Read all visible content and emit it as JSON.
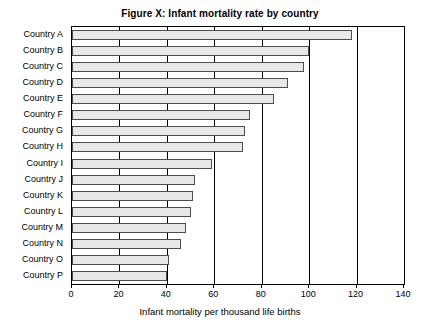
{
  "chart_data": {
    "type": "bar",
    "orientation": "horizontal",
    "title": "Figure X: Infant mortality rate by country",
    "xlabel": "Infant mortality per thousand life births",
    "ylabel": "",
    "xlim": [
      0,
      140
    ],
    "xticks": [
      0,
      20,
      40,
      60,
      80,
      100,
      120,
      140
    ],
    "grid": true,
    "grid_axis": "x",
    "legend": null,
    "bar_fill": "#e8e8e8",
    "bar_edge": "#4d4d4d",
    "categories": [
      "Country A",
      "Country B",
      "Country C",
      "Country D",
      "Country E",
      "Country F",
      "Country G",
      "Country H",
      "Country I",
      "Country J",
      "Country K",
      "Country L",
      "Country M",
      "Country N",
      "Country O",
      "Country P"
    ],
    "values": [
      118,
      100,
      98,
      91,
      85,
      75,
      73,
      72,
      59,
      52,
      51,
      50,
      48,
      46,
      41,
      40
    ]
  }
}
